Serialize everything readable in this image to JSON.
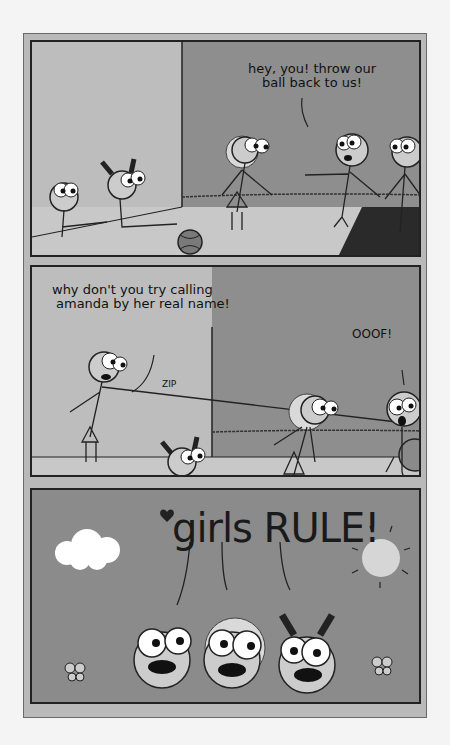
{
  "panels": [
    {
      "id": 1,
      "speech": "hey, you! throw our ball back to us!",
      "speech_lines": [
        "hey, you! throw our",
        "ball back to us!"
      ]
    },
    {
      "id": 2,
      "speech_lines": [
        "why don't you try calling",
        "amanda by her real name!"
      ],
      "sfx_zip": "ZIP",
      "sfx_ooof": "OOOF!"
    },
    {
      "id": 3,
      "title": "girls RULE!"
    }
  ],
  "colors": {
    "page": "#f4f4f4",
    "frame": "#b9b9b9",
    "wall_light": "#bdbdbd",
    "wall_dark": "#8e8e8e",
    "floor": "#c8c8c8",
    "ink": "#1a1a1a"
  }
}
